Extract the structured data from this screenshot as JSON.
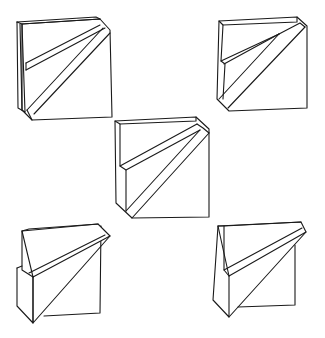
{
  "figure": {
    "stroke_color": "#1a1a1a",
    "background": "#ffffff",
    "blocks": [
      {
        "id": "block-top-left",
        "position": "top-left"
      },
      {
        "id": "block-top-right",
        "position": "top-right"
      },
      {
        "id": "block-center",
        "position": "center"
      },
      {
        "id": "block-bottom-left",
        "position": "bottom-left"
      },
      {
        "id": "block-bottom-right",
        "position": "bottom-right"
      }
    ]
  }
}
